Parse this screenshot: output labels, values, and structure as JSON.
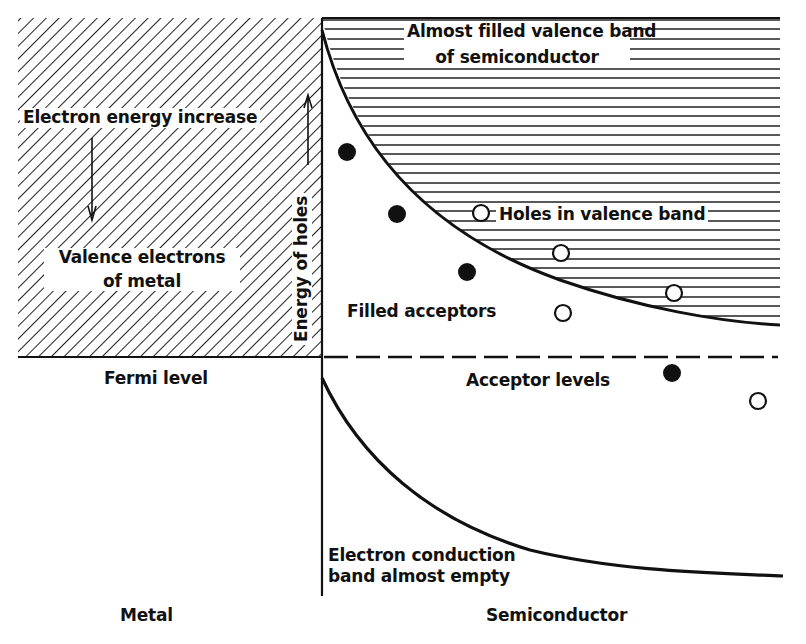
{
  "diagram": {
    "regions": {
      "metal": "Metal",
      "semiconductor": "Semiconductor"
    },
    "labels": {
      "electron_energy_increase": "Electron energy increase",
      "valence_electrons_line1": "Valence electrons",
      "valence_electrons_line2": "of metal",
      "energy_of_holes": "Energy of holes",
      "fermi_level": "Fermi level",
      "almost_filled_line1": "Almost filled valence band",
      "almost_filled_line2": "of semiconductor",
      "holes_in_valence_band": "Holes in valence band",
      "filled_acceptors": "Filled acceptors",
      "acceptor_levels": "Acceptor levels",
      "conduction_line1": "Electron conduction",
      "conduction_line2": "band almost empty"
    },
    "markers": {
      "filled_acceptors": [
        [
          347,
          152
        ],
        [
          397,
          214
        ],
        [
          467,
          272
        ],
        [
          672,
          373
        ]
      ],
      "holes_in_valence": [
        [
          481,
          213
        ],
        [
          561,
          253
        ],
        [
          674,
          293
        ]
      ],
      "empty_acceptors": [
        [
          563,
          313
        ],
        [
          758,
          401
        ]
      ]
    },
    "colors": {
      "ink": "#111111",
      "paper": "#ffffff"
    }
  }
}
